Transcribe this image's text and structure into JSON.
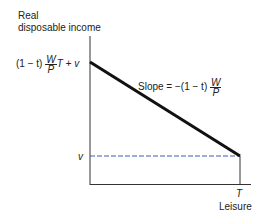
{
  "diagram": {
    "y_axis_label_line1": "Real",
    "y_axis_label_line2": "disposable income",
    "x_axis_label": "Leisure",
    "x_tick_T": "T",
    "y_tick_intercept": {
      "prefix": "(1 − t)",
      "frac_num": "W",
      "frac_den": "P",
      "suffix": "T + v"
    },
    "y_tick_v": "v",
    "slope_label": {
      "prefix": "Slope = −(1 − t)",
      "frac_num": "W",
      "frac_den": "P"
    },
    "colors": {
      "budget_line": "#111111",
      "dashed_line": "#3a5fb0",
      "axes": "#333333"
    }
  }
}
